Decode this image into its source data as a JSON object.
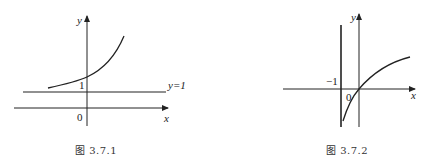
{
  "figures": [
    {
      "caption": "图 3.7.1",
      "axis_x_label": "x",
      "axis_y_label": "y",
      "origin_label": "0",
      "tick_y_label": "1",
      "asymptote_label": "y=1",
      "curve": "increasing exponential-like curve approaching y=1 as x → -∞"
    },
    {
      "caption": "图 3.7.2",
      "axis_x_label": "x",
      "axis_y_label": "y",
      "origin_label": "0",
      "tick_x_label": "−1",
      "asymptote": "vertical line x=-1",
      "curve": "increasing logarithmic-like curve through origin, asymptotic to x=-1"
    }
  ],
  "colors": {
    "line": "#222222",
    "background": "#ffffff"
  }
}
